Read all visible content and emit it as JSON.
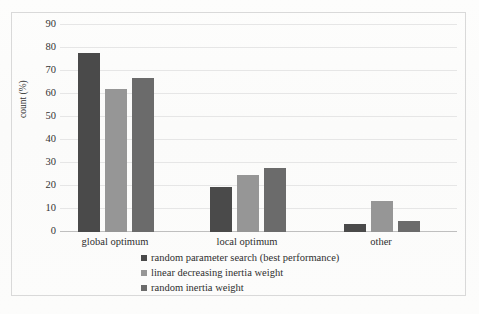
{
  "chart_data": {
    "type": "bar",
    "title": "",
    "xlabel": "",
    "ylabel": "count (%)",
    "categories": [
      "global optimum",
      "local optimum",
      "other"
    ],
    "series": [
      {
        "name": "random parameter search (best performance)",
        "color": "#4a4a4a",
        "values": [
          78,
          19.5,
          3.5
        ]
      },
      {
        "name": "linear decreasing inertia weight",
        "color": "#969696",
        "values": [
          62,
          25,
          13.5
        ]
      },
      {
        "name": "random inertia weight",
        "color": "#6b6b6b",
        "values": [
          67,
          28,
          5
        ]
      }
    ],
    "ylim": [
      0,
      90
    ],
    "yticks": [
      0,
      10,
      20,
      30,
      40,
      50,
      60,
      70,
      80,
      90
    ],
    "ytick_labels": [
      "0",
      "10",
      "20",
      "30",
      "40",
      "50",
      "60",
      "70",
      "80",
      "90"
    ],
    "grid": "horizontal",
    "legend_position": "bottom-center",
    "border_color": "#d9d9d9",
    "gridline_color": "#e6e6e6"
  }
}
